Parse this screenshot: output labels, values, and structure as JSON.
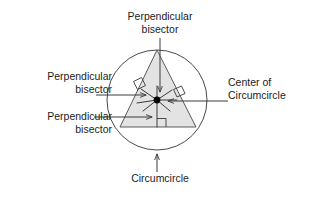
{
  "figure": {
    "title_text": "Circumcircle and perpendicular bisectors of a triangle",
    "labels": {
      "perpendicular_bisector_top_line1": "Perpendicular",
      "perpendicular_bisector_top_line2": "bisector",
      "perpendicular_bisector_left_line1": "Perpendicular",
      "perpendicular_bisector_left_line2": "bisector",
      "perpendicular_bisector_lower_line1": "Perpendicular",
      "perpendicular_bisector_lower_line2": "bisector",
      "center_of_circumcircle_line1": "Center of",
      "center_of_circumcircle_line2": "Circumcircle",
      "circumcircle": "Circumcircle"
    },
    "colors": {
      "stroke": "#3a3a3a",
      "triangle_fill": "#e2e2e2",
      "triangle_stroke": "#555555",
      "center_dot": "#000000",
      "text": "#1c1c1c",
      "background": "#ffffff"
    },
    "geometry": {
      "circle_center_x": 157,
      "circle_center_y": 100,
      "circle_radius": 50,
      "triangle_apex_x": 157,
      "triangle_apex_y": 50,
      "triangle_base_left_x": 120,
      "triangle_base_left_y": 127,
      "triangle_base_right_x": 196,
      "triangle_base_right_y": 127,
      "right_angle_marker_count": 3
    }
  }
}
